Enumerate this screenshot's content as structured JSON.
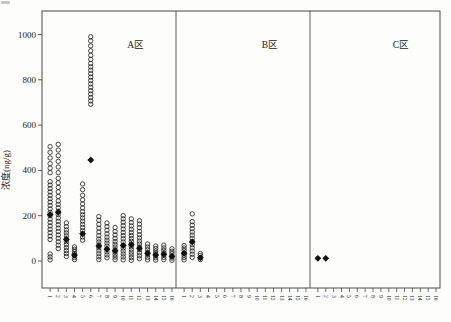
{
  "figure": {
    "ylabel": "浓度(ng/g)",
    "panel_labels": [
      "A区",
      "B区",
      "C区"
    ]
  },
  "chart_data": {
    "type": "scatter",
    "title": "",
    "xlabel": "",
    "ylabel": "浓度(ng/g)",
    "ylim": [
      -120,
      1100
    ],
    "yticks": [
      0,
      200,
      400,
      600,
      800,
      1000
    ],
    "grid": false,
    "legend": "none",
    "marker_styles": {
      "circle": "open circle = individual sample concentration",
      "diamond": "filled diamond = mean value"
    },
    "colors": {
      "background": "#fdfdfb",
      "frame": "#4a4a4a",
      "marker_stroke": "#1c1c1c",
      "marker_fill": "#111111"
    },
    "panels": [
      {
        "label": "A区",
        "site_labels": [
          "1",
          "2",
          "3",
          "4",
          "5",
          "6",
          "7",
          "8",
          "9",
          "10",
          "11",
          "12",
          "13",
          "14",
          "15",
          "16"
        ],
        "sites": [
          {
            "circles": [
              5,
              18,
              31,
              95,
              110,
              125,
              140,
              155,
              170,
              185,
              200,
              215,
              230,
              245,
              260,
              275,
              290,
              305,
              320,
              335,
              350,
              390,
              410,
              430,
              455,
              480,
              505
            ],
            "mean": 205
          },
          {
            "circles": [
              55,
              70,
              85,
              100,
              115,
              130,
              145,
              160,
              175,
              190,
              205,
              220,
              235,
              250,
              265,
              285,
              305,
              325,
              345,
              365,
              390,
              415,
              440,
              465,
              490,
              515
            ],
            "mean": 215
          },
          {
            "circles": [
              20,
              33,
              46,
              59,
              72,
              85,
              98,
              111,
              124,
              137,
              152,
              168
            ],
            "mean": 95
          },
          {
            "circles": [
              6,
              15,
              24,
              33,
              42,
              52,
              62
            ],
            "mean": 26
          },
          {
            "circles": [
              92,
              106,
              120,
              134,
              148,
              162,
              176,
              190,
              204,
              218,
              234,
              252,
              270,
              290,
              315,
              340
            ],
            "mean": 120
          },
          {
            "circles": [
              692,
              707,
              722,
              737,
              752,
              767,
              782,
              797,
              812,
              827,
              842,
              857,
              872,
              890,
              908,
              928,
              950,
              972,
              990
            ],
            "mean": 446
          },
          {
            "circles": [
              6,
              19,
              32,
              45,
              58,
              71,
              84,
              97,
              112,
              128,
              145,
              162,
              180,
              196
            ],
            "mean": 66
          },
          {
            "circles": [
              14,
              27,
              40,
              53,
              66,
              79,
              92,
              105,
              120,
              136,
              152,
              168
            ],
            "mean": 52
          },
          {
            "circles": [
              6,
              17,
              28,
              39,
              50,
              62,
              74,
              86,
              100,
              115,
              130,
              148
            ],
            "mean": 45
          },
          {
            "circles": [
              5,
              18,
              31,
              44,
              57,
              70,
              84,
              98,
              112,
              126,
              141,
              156,
              171,
              186,
              200
            ],
            "mean": 68
          },
          {
            "circles": [
              3,
              15,
              27,
              39,
              51,
              63,
              75,
              87,
              99,
              112,
              126,
              140,
              155,
              170,
              186
            ],
            "mean": 72
          },
          {
            "circles": [
              10,
              23,
              36,
              49,
              62,
              75,
              88,
              102,
              116,
              131,
              147,
              163,
              178
            ],
            "mean": 56
          },
          {
            "circles": [
              5,
              16,
              27,
              38,
              50,
              62,
              75
            ],
            "mean": 34
          },
          {
            "circles": [
              4,
              14,
              24,
              34,
              44,
              55,
              66
            ],
            "mean": 27
          },
          {
            "circles": [
              6,
              16,
              26,
              36,
              47,
              58,
              70
            ],
            "mean": 30
          },
          {
            "circles": [
              3,
              13,
              23,
              33,
              43,
              54
            ],
            "mean": 20
          }
        ]
      },
      {
        "label": "B区",
        "site_labels": [
          "1",
          "2",
          "3",
          "4",
          "5",
          "6",
          "7",
          "8",
          "9",
          "10",
          "11",
          "12",
          "13",
          "14",
          "15",
          "16"
        ],
        "sites": [
          {
            "circles": [
              5,
              15,
              25,
              35,
              46,
              57,
              68
            ],
            "mean": 34
          },
          {
            "circles": [
              16,
              30,
              44,
              58,
              72,
              86,
              100,
              114,
              128,
              143,
              158,
              174,
              208
            ],
            "mean": 84
          },
          {
            "circles": [
              6,
              15,
              24,
              33
            ],
            "mean": 14
          },
          {
            "circles": [],
            "mean": null
          },
          {
            "circles": [],
            "mean": null
          },
          {
            "circles": [],
            "mean": null
          },
          {
            "circles": [],
            "mean": null
          },
          {
            "circles": [],
            "mean": null
          },
          {
            "circles": [],
            "mean": null
          },
          {
            "circles": [],
            "mean": null
          },
          {
            "circles": [],
            "mean": null
          },
          {
            "circles": [],
            "mean": null
          },
          {
            "circles": [],
            "mean": null
          },
          {
            "circles": [],
            "mean": null
          },
          {
            "circles": [],
            "mean": null
          },
          {
            "circles": [],
            "mean": null
          }
        ]
      },
      {
        "label": "C区",
        "site_labels": [
          "1",
          "2",
          "3",
          "4",
          "5",
          "6",
          "7",
          "8",
          "9",
          "10",
          "11",
          "12",
          "13",
          "14",
          "15",
          "16"
        ],
        "sites": [
          {
            "circles": [],
            "mean": 12
          },
          {
            "circles": [],
            "mean": 12
          },
          {
            "circles": [],
            "mean": null
          },
          {
            "circles": [],
            "mean": null
          },
          {
            "circles": [],
            "mean": null
          },
          {
            "circles": [],
            "mean": null
          },
          {
            "circles": [],
            "mean": null
          },
          {
            "circles": [],
            "mean": null
          },
          {
            "circles": [],
            "mean": null
          },
          {
            "circles": [],
            "mean": null
          },
          {
            "circles": [],
            "mean": null
          },
          {
            "circles": [],
            "mean": null
          },
          {
            "circles": [],
            "mean": null
          },
          {
            "circles": [],
            "mean": null
          },
          {
            "circles": [],
            "mean": null
          },
          {
            "circles": [],
            "mean": null
          }
        ]
      }
    ],
    "layout": {
      "frame": {
        "left": 42,
        "top": 11,
        "right": 440,
        "bottom": 288
      },
      "panel_dividers_x": [
        176,
        310
      ],
      "value_y0_px": 261,
      "px_per_unit": 0.2265
    }
  }
}
